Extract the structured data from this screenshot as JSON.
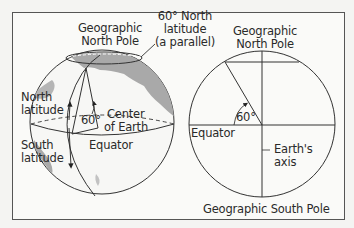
{
  "diagram": {
    "left_globe": {
      "labels": {
        "north_pole_line1": "Geographic",
        "north_pole_line2": "North Pole",
        "parallel_line1": "60° North",
        "parallel_line2": "latitude",
        "parallel_line3": "(a parallel)",
        "north_lat_line1": "North",
        "north_lat_line2": "latitude",
        "south_lat_line1": "South",
        "south_lat_line2": "latitude",
        "angle": "60°",
        "center_line1": "Center",
        "center_line2": "of Earth",
        "equator": "Equator"
      }
    },
    "right_cross_section": {
      "labels": {
        "north_pole_line1": "Geographic",
        "north_pole_line2": "North Pole",
        "angle": "60°",
        "equator": "Equator",
        "axis_line1": "Earth's",
        "axis_line2": "axis",
        "south_pole": "Geographic South Pole"
      }
    },
    "colors": {
      "line": "#333333",
      "land": "#a9a9a9",
      "background": "#fafaf8",
      "frame": "#555555"
    }
  }
}
